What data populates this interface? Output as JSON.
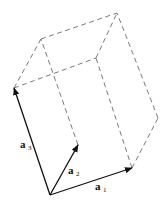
{
  "figure": {
    "vectors": [
      {
        "name": "a1",
        "base": "a",
        "subscript": "1",
        "from": [
          50,
          195
        ],
        "to": [
          132,
          168
        ]
      },
      {
        "name": "a2",
        "base": "a",
        "subscript": "2",
        "from": [
          50,
          195
        ],
        "to": [
          78,
          145
        ]
      },
      {
        "name": "a3",
        "base": "a",
        "subscript": "3",
        "from": [
          50,
          195
        ],
        "to": [
          14,
          88
        ]
      }
    ],
    "labels": {
      "a1": {
        "base": "a",
        "sub": "1"
      },
      "a2": {
        "base": "a",
        "sub": "2"
      },
      "a3": {
        "base": "a",
        "sub": "3"
      }
    },
    "colors": {
      "vector": "#111111",
      "dashed_edge": "#6b6b6b",
      "background": "#ffffff"
    }
  }
}
